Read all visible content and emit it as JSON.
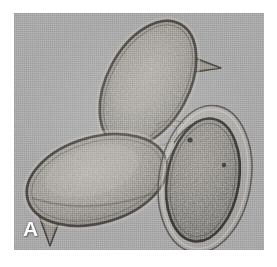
{
  "figure": {
    "panel_label": "A",
    "caption": "",
    "modality": "light-micrograph",
    "background_color": "#a9a9a9",
    "page_color": "#ffffff",
    "label_color": "#ffffff",
    "plate": {
      "x": 14,
      "y": 13,
      "width": 250,
      "height": 237
    }
  },
  "specimens": [
    {
      "id": "cell-top",
      "name": "ovoid-cell-upper",
      "description": "elongated ovoid cell, long axis tilted up-right, pointed apical spine projecting to the upper right",
      "center": {
        "x": 148,
        "y": 84
      },
      "radius_x": 41,
      "radius_y": 68,
      "rotation_deg": 28,
      "has_spine": true,
      "spine_direction": "upper-right",
      "interior": "fine granular mottled cytoplasm",
      "wall_color": "#4a4742",
      "fill_color": "#9a968f"
    },
    {
      "id": "cell-left",
      "name": "ovoid-cell-lower-left",
      "description": "broad ovoid cell lying obliquely, long axis from lower-left to upper-right, short pointed spine at the lower-left pole",
      "center": {
        "x": 97,
        "y": 180
      },
      "radius_x": 72,
      "radius_y": 43,
      "rotation_deg": -16,
      "has_spine": true,
      "spine_direction": "lower-left",
      "interior": "coarse granular cytoplasm with light central zone",
      "wall_color": "#46433e",
      "fill_color": "#9d9992"
    },
    {
      "id": "cell-right",
      "name": "ovoid-cell-lower-right",
      "description": "dark densely granular ovoid cell enclosed by a loose transparent outer envelope, long axis vertical and slightly tilted right",
      "center": {
        "x": 203,
        "y": 180
      },
      "radius_x": 36,
      "radius_y": 62,
      "rotation_deg": 9,
      "has_spine": false,
      "has_envelope": true,
      "interior": "dense dark granular contents",
      "wall_color": "#3a3733",
      "fill_color": "#7e7a74"
    }
  ],
  "annotations": {
    "scale_bar": null,
    "arrows": [],
    "text_labels": [
      {
        "text": "A",
        "x": 23,
        "y": 218,
        "color": "#ffffff",
        "role": "panel-letter"
      }
    ]
  }
}
